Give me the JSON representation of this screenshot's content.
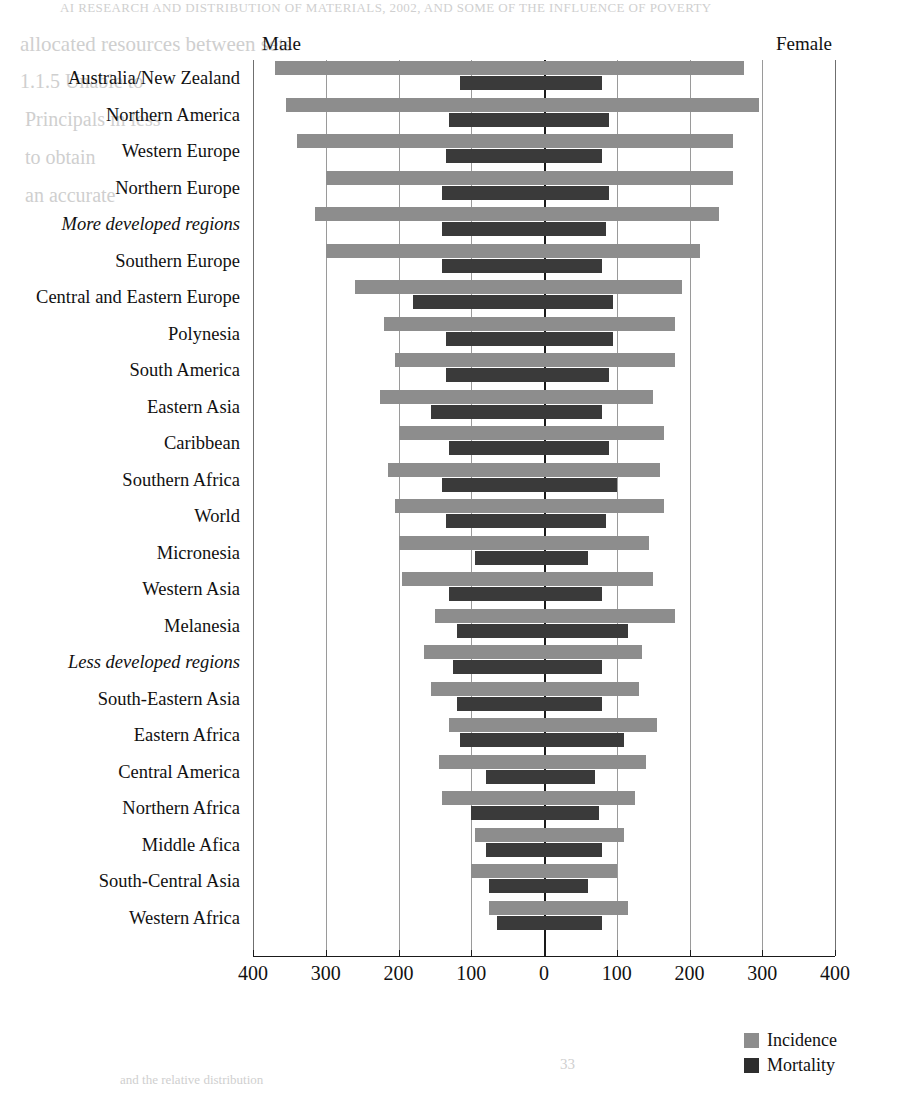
{
  "page": {
    "bleed_through": {
      "header": "AI  RESEARCH AND DISTRIBUTION OF MATERIALS, 2002, AND SOME OF THE INFLUENCE OF POVERTY",
      "line1": "allocated resources between sets",
      "line2": "1.1.5  Unable to",
      "line3": "Principals in less",
      "line4": "to obtain",
      "line5": "an accurate",
      "footer1": "33",
      "footer2": "and the relative distribution"
    }
  },
  "chart": {
    "male_label": "Male",
    "female_label": "Female",
    "legend": [
      {
        "key": "incidence",
        "label": "Incidence",
        "color": "#8d8d8d"
      },
      {
        "key": "mortality",
        "label": "Mortality",
        "color": "#2e2e2e"
      }
    ],
    "axis": {
      "tick_labels": [
        "400",
        "300",
        "200",
        "100",
        "0",
        "100",
        "200",
        "300",
        "400"
      ],
      "tick_values": [
        -400,
        -300,
        -200,
        -100,
        0,
        100,
        200,
        300,
        400
      ]
    }
  },
  "chart_data": {
    "type": "bar",
    "title": "",
    "subtitle": "",
    "orientation": "horizontal-diverging",
    "xlabel": "",
    "ylabel": "",
    "xlim": [
      -400,
      400
    ],
    "grid": true,
    "legend_position": "bottom-right",
    "left_side": "Male",
    "right_side": "Female",
    "note": "Left (Male) values are plotted leftward from 0; right (Female) values rightward. Units are age-standardised rates per 100,000.",
    "categories": [
      "Australia/New Zealand",
      "Northern America",
      "Western Europe",
      "Northern Europe",
      "More developed regions",
      "Southern Europe",
      "Central and Eastern Europe",
      "Polynesia",
      "South America",
      "Eastern Asia",
      "Caribbean",
      "Southern Africa",
      "World",
      "Micronesia",
      "Western Asia",
      "Melanesia",
      "Less developed regions",
      "South-Eastern Asia",
      "Eastern Africa",
      "Central America",
      "Northern Africa",
      "Middle Afica",
      "South-Central Asia",
      "Western Africa"
    ],
    "aggregate_categories": [
      "More developed regions",
      "Less developed regions"
    ],
    "series": [
      {
        "name": "Incidence",
        "color": "#8d8d8d",
        "male": [
          370,
          355,
          340,
          300,
          315,
          300,
          260,
          220,
          205,
          225,
          200,
          215,
          205,
          200,
          195,
          150,
          165,
          155,
          130,
          145,
          140,
          95,
          100,
          75
        ],
        "female": [
          275,
          295,
          260,
          260,
          240,
          215,
          190,
          180,
          180,
          150,
          165,
          160,
          165,
          145,
          150,
          180,
          135,
          130,
          155,
          140,
          125,
          110,
          100,
          115
        ]
      },
      {
        "name": "Mortality",
        "color": "#3a3a3a",
        "male": [
          115,
          130,
          135,
          140,
          140,
          140,
          180,
          135,
          135,
          155,
          130,
          140,
          135,
          95,
          130,
          120,
          125,
          120,
          115,
          80,
          100,
          80,
          75,
          65
        ],
        "female": [
          80,
          90,
          80,
          90,
          85,
          80,
          95,
          95,
          90,
          80,
          90,
          100,
          85,
          60,
          80,
          115,
          80,
          80,
          110,
          70,
          75,
          80,
          60,
          80
        ]
      }
    ]
  }
}
